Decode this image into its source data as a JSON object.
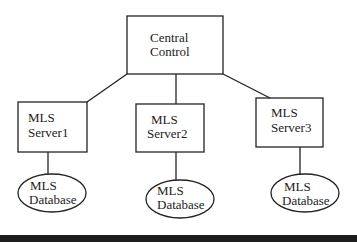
{
  "diagram": {
    "central": {
      "line1": "Central",
      "line2": "Control"
    },
    "servers": [
      {
        "line1": "MLS",
        "line2": "Server1"
      },
      {
        "line1": "MLS",
        "line2": "Server2"
      },
      {
        "line1": "MLS",
        "line2": "Server3"
      }
    ],
    "databases": [
      {
        "line1": "MLS",
        "line2": "Database"
      },
      {
        "line1": "MLS",
        "line2": "Database"
      },
      {
        "line1": "MLS",
        "line2": "Database"
      }
    ],
    "colors": {
      "stroke": "#222222",
      "background": "#ffffff",
      "bottom_bar": "#1e1e1e"
    }
  }
}
